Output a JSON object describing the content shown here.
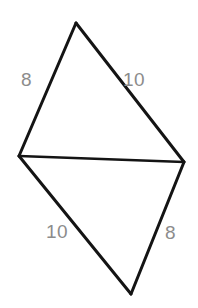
{
  "figure": {
    "name": "kite-quadrilateral-with-diagonal",
    "stroke_color": "#141414",
    "label_color": "#8c8c8c",
    "background_color": "#ffffff",
    "width": 198,
    "height": 308,
    "vertices": {
      "top": {
        "name": "apex-vertex",
        "x": 76,
        "y": 23
      },
      "left": {
        "name": "left-vertex",
        "x": 19,
        "y": 156
      },
      "right": {
        "name": "right-vertex",
        "x": 184,
        "y": 162
      },
      "bottom": {
        "name": "bottom-vertex",
        "x": 131,
        "y": 294
      }
    },
    "edges": [
      {
        "name": "top-left-edge",
        "from": "top",
        "to": "left",
        "label": "8"
      },
      {
        "name": "top-right-edge",
        "from": "top",
        "to": "right",
        "label": "10"
      },
      {
        "name": "bottom-left-edge",
        "from": "left",
        "to": "bottom",
        "label": "10"
      },
      {
        "name": "bottom-right-edge",
        "from": "right",
        "to": "bottom",
        "label": "8"
      },
      {
        "name": "shared-diagonal",
        "from": "left",
        "to": "right",
        "label": ""
      }
    ],
    "labels": {
      "top_left": "8",
      "top_right": "10",
      "bottom_left": "10",
      "bottom_right": "8"
    }
  }
}
